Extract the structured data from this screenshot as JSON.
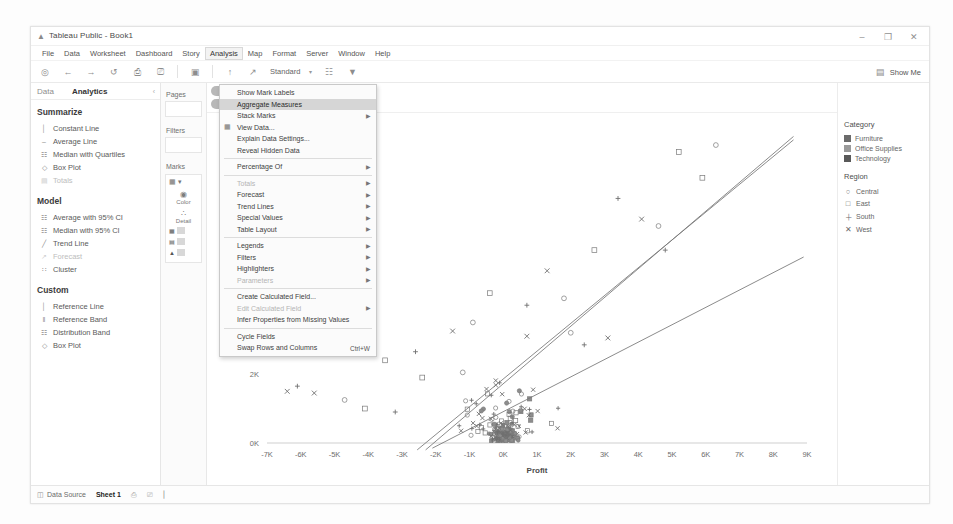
{
  "window": {
    "title": "Tableau Public - Book1",
    "app_icon": "tableau-icon",
    "controls": {
      "minimize": "–",
      "maximize": "❐",
      "close": "✕"
    }
  },
  "menubar": {
    "items": [
      {
        "label": "File"
      },
      {
        "label": "Data"
      },
      {
        "label": "Worksheet"
      },
      {
        "label": "Dashboard"
      },
      {
        "label": "Story"
      },
      {
        "label": "Analysis",
        "active": true
      },
      {
        "label": "Map"
      },
      {
        "label": "Format"
      },
      {
        "label": "Server"
      },
      {
        "label": "Window"
      },
      {
        "label": "Help"
      }
    ]
  },
  "toolbar": {
    "icons": [
      "tableau-home-icon",
      "undo-arrow-icon",
      "redo-arrow-icon",
      "save-icon",
      "new-worksheet-icon",
      "duplicate-sheet-icon",
      "clear-sheet-icon"
    ],
    "sort_icons": [
      "sort-ascending-icon",
      "sort-descending-icon"
    ],
    "fit_value": "Standard",
    "fit_caret": "▾",
    "extra_icons": [
      "highlight-icon",
      "fix-axis-icon"
    ],
    "show_me_label": "Show Me",
    "show_me_icon": "show-me-icon"
  },
  "analytics_pane": {
    "tabs": [
      {
        "label": "Data",
        "selected": false
      },
      {
        "label": "Analytics",
        "selected": true
      }
    ],
    "collapse_icon": "‹",
    "groups": [
      {
        "title": "Summarize",
        "items": [
          {
            "label": "Constant Line",
            "icon": "constant-line-icon",
            "glyph": "│",
            "disabled": false
          },
          {
            "label": "Average Line",
            "icon": "average-line-icon",
            "glyph": "‒",
            "disabled": false
          },
          {
            "label": "Median with Quartiles",
            "icon": "median-quartiles-icon",
            "glyph": "☷",
            "disabled": false
          },
          {
            "label": "Box Plot",
            "icon": "box-plot-icon",
            "glyph": "◇",
            "disabled": false
          },
          {
            "label": "Totals",
            "icon": "totals-icon",
            "glyph": "▤",
            "disabled": true
          }
        ]
      },
      {
        "title": "Model",
        "items": [
          {
            "label": "Average with 95% CI",
            "icon": "average-ci-icon",
            "glyph": "☷",
            "disabled": false
          },
          {
            "label": "Median with 95% CI",
            "icon": "median-ci-icon",
            "glyph": "☷",
            "disabled": false
          },
          {
            "label": "Trend Line",
            "icon": "trend-line-icon",
            "glyph": "╱",
            "disabled": false
          },
          {
            "label": "Forecast",
            "icon": "forecast-icon",
            "glyph": "↗",
            "disabled": true
          },
          {
            "label": "Cluster",
            "icon": "cluster-icon",
            "glyph": "∷",
            "disabled": false
          }
        ]
      },
      {
        "title": "Custom",
        "items": [
          {
            "label": "Reference Line",
            "icon": "reference-line-icon",
            "glyph": "│",
            "disabled": false
          },
          {
            "label": "Reference Band",
            "icon": "reference-band-icon",
            "glyph": "‖",
            "disabled": false
          },
          {
            "label": "Distribution Band",
            "icon": "distribution-band-icon",
            "glyph": "☷",
            "disabled": false
          },
          {
            "label": "Box Plot",
            "icon": "box-plot-icon",
            "glyph": "◇",
            "disabled": false
          }
        ]
      }
    ]
  },
  "shelves": {
    "pages_label": "Pages",
    "filters_label": "Filters",
    "marks_label": "Marks",
    "marks_type": "Automatic",
    "marks_type_caret": "▾",
    "buttons": [
      {
        "label": "Color",
        "icon": "color-icon",
        "glyph": "⁙"
      },
      {
        "label": "Detail",
        "icon": "detail-icon",
        "glyph": "∴"
      }
    ],
    "pills": [
      "category-pill",
      "region-pill",
      "sub-category-pill"
    ]
  },
  "chart_data": {
    "type": "scatter",
    "title": "",
    "xlabel": "Profit",
    "ylabel": "Sales",
    "xticks": [
      "-7K",
      "-6K",
      "-5K",
      "-4K",
      "-3K",
      "-2K",
      "-1K",
      "0K",
      "1K",
      "2K",
      "3K",
      "4K",
      "5K",
      "6K",
      "7K",
      "8K",
      "9K"
    ],
    "yticks": [
      "0K",
      "2K",
      "4K",
      "6K",
      "8K"
    ],
    "xlim": [
      -7000,
      9000
    ],
    "ylim": [
      0,
      9000
    ],
    "grid": false,
    "legend_position": "right",
    "trendlines": [
      {
        "name": "trend-1",
        "slope_label": "steep"
      },
      {
        "name": "trend-2",
        "slope_label": "steep"
      },
      {
        "name": "trend-3",
        "slope_label": "shallow"
      }
    ],
    "series": [
      {
        "name": "Central",
        "marker": "circle"
      },
      {
        "name": "East",
        "marker": "square"
      },
      {
        "name": "South",
        "marker": "plus"
      },
      {
        "name": "West",
        "marker": "cross"
      }
    ],
    "point_count_approx": 330
  },
  "legend": {
    "category": {
      "title": "Category",
      "items": [
        {
          "label": "Furniture",
          "color": "#6b6b6b"
        },
        {
          "label": "Office Supplies",
          "color": "#9a9a9a"
        },
        {
          "label": "Technology",
          "color": "#595959"
        }
      ]
    },
    "region": {
      "title": "Region",
      "items": [
        {
          "label": "Central",
          "glyph": "○"
        },
        {
          "label": "East",
          "glyph": "□"
        },
        {
          "label": "South",
          "glyph": "＋"
        },
        {
          "label": "West",
          "glyph": "✕"
        }
      ]
    }
  },
  "statusbar": {
    "data_source_label": "Data Source",
    "data_source_icon": "data-source-icon",
    "sheet_label": "Sheet 1",
    "tab_icons": [
      "new-worksheet-icon",
      "new-dashboard-icon",
      "new-story-icon"
    ]
  },
  "analysis_menu": {
    "items": [
      {
        "label": "Show Mark Labels",
        "type": "item"
      },
      {
        "label": "Aggregate Measures",
        "type": "item",
        "highlighted": true
      },
      {
        "label": "Stack Marks",
        "type": "submenu"
      },
      {
        "label": "View Data...",
        "type": "item",
        "left_icon": "table-icon"
      },
      {
        "label": "Explain Data Settings...",
        "type": "item"
      },
      {
        "label": "Reveal Hidden Data",
        "type": "item"
      },
      {
        "type": "separator"
      },
      {
        "label": "Percentage Of",
        "type": "submenu"
      },
      {
        "type": "separator"
      },
      {
        "label": "Totals",
        "type": "submenu",
        "disabled": true
      },
      {
        "label": "Forecast",
        "type": "submenu"
      },
      {
        "label": "Trend Lines",
        "type": "submenu"
      },
      {
        "label": "Special Values",
        "type": "submenu"
      },
      {
        "label": "Table Layout",
        "type": "submenu"
      },
      {
        "type": "separator"
      },
      {
        "label": "Legends",
        "type": "submenu"
      },
      {
        "label": "Filters",
        "type": "submenu"
      },
      {
        "label": "Highlighters",
        "type": "submenu"
      },
      {
        "label": "Parameters",
        "type": "submenu",
        "disabled": true
      },
      {
        "type": "separator"
      },
      {
        "label": "Create Calculated Field...",
        "type": "item"
      },
      {
        "label": "Edit Calculated Field",
        "type": "submenu",
        "disabled": true
      },
      {
        "label": "Infer Properties from Missing Values",
        "type": "item"
      },
      {
        "type": "separator"
      },
      {
        "label": "Cycle Fields",
        "type": "item"
      },
      {
        "label": "Swap Rows and Columns",
        "type": "item",
        "shortcut": "Ctrl+W"
      }
    ]
  }
}
